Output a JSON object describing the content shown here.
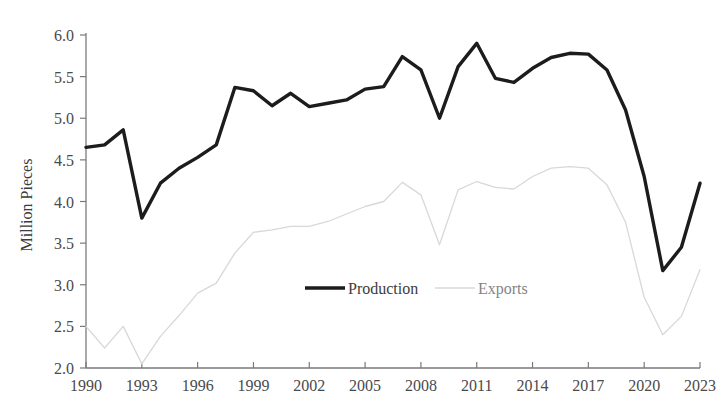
{
  "chart_data": {
    "type": "line",
    "title": "",
    "xlabel": "",
    "ylabel": "Million Pieces",
    "ylim": [
      2.0,
      6.0
    ],
    "xlim": [
      1990,
      2023
    ],
    "grid": false,
    "legend_position": "inside-bottom-center",
    "y_ticks": [
      "2.0",
      "2.5",
      "3.0",
      "3.5",
      "4.0",
      "4.5",
      "5.0",
      "5.5",
      "6.0"
    ],
    "x_ticks": [
      "1990",
      "1993",
      "1996",
      "1999",
      "2002",
      "2005",
      "2008",
      "2011",
      "2014",
      "2017",
      "2020",
      "2023"
    ],
    "x": [
      1990,
      1991,
      1992,
      1993,
      1994,
      1995,
      1996,
      1997,
      1998,
      1999,
      2000,
      2001,
      2002,
      2003,
      2004,
      2005,
      2006,
      2007,
      2008,
      2009,
      2010,
      2011,
      2012,
      2013,
      2014,
      2015,
      2016,
      2017,
      2018,
      2019,
      2020,
      2021,
      2022,
      2023
    ],
    "series": [
      {
        "name": "Production",
        "color": "#1c1c1c",
        "width": 3.4,
        "values": [
          4.65,
          4.68,
          4.86,
          3.8,
          4.22,
          4.4,
          4.53,
          4.68,
          5.37,
          5.33,
          5.15,
          5.3,
          5.14,
          5.18,
          5.22,
          5.35,
          5.38,
          5.74,
          5.58,
          5.0,
          5.62,
          5.9,
          5.48,
          5.43,
          5.6,
          5.73,
          5.78,
          5.77,
          5.58,
          5.1,
          4.3,
          3.17,
          3.45,
          4.22
        ]
      },
      {
        "name": "Exports",
        "color": "#d8d8d8",
        "width": 1.3,
        "values": [
          2.5,
          2.24,
          2.5,
          2.05,
          2.38,
          2.63,
          2.9,
          3.02,
          3.38,
          3.63,
          3.66,
          3.7,
          3.7,
          3.76,
          3.85,
          3.94,
          4.0,
          4.23,
          4.08,
          3.48,
          4.14,
          4.24,
          4.17,
          4.15,
          4.3,
          4.4,
          4.42,
          4.4,
          4.2,
          3.75,
          2.85,
          2.4,
          2.62,
          3.18
        ]
      }
    ]
  },
  "legend": {
    "items": [
      {
        "label": "Production"
      },
      {
        "label": "Exports"
      }
    ]
  }
}
